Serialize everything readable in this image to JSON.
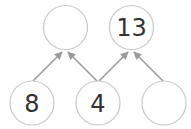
{
  "diagram": {
    "type": "number-pyramid",
    "colors": {
      "circle_stroke": "#c8c8c8",
      "arrow": "#9a9a9a",
      "text": "#333333"
    },
    "top_row": [
      {
        "id": "top-left",
        "value": ""
      },
      {
        "id": "top-right",
        "value": "13"
      }
    ],
    "bottom_row": [
      {
        "id": "bottom-left",
        "value": "8"
      },
      {
        "id": "bottom-middle",
        "value": "4"
      },
      {
        "id": "bottom-right",
        "value": ""
      }
    ],
    "arrows": [
      {
        "from": "bottom-left",
        "to": "top-left"
      },
      {
        "from": "bottom-middle",
        "to": "top-left"
      },
      {
        "from": "bottom-middle",
        "to": "top-right"
      },
      {
        "from": "bottom-right",
        "to": "top-right"
      }
    ]
  }
}
